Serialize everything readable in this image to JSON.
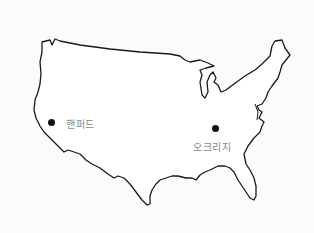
{
  "map": {
    "region": "contiguous-united-states",
    "outline_color": "#1a1a1a",
    "fill_color": "#ffffff",
    "background_color": "#fbfbfb",
    "markers": [
      {
        "label": "핸퍼드",
        "x": 51,
        "y": 122,
        "label_x": 66,
        "label_y": 116
      },
      {
        "label": "오크리지",
        "x": 215,
        "y": 128,
        "label_x": 193,
        "label_y": 139
      }
    ]
  }
}
